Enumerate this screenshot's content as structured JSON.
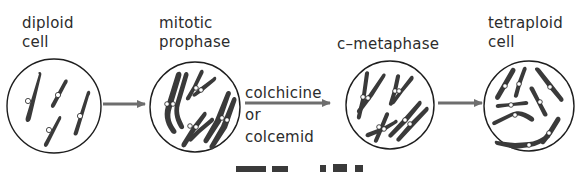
{
  "diagram": {
    "stages": [
      {
        "id": "diploid",
        "label_line1": "diploid",
        "label_line2": "cell"
      },
      {
        "id": "prophase",
        "label_line1": "mitotic",
        "label_line2": "prophase"
      },
      {
        "id": "c-metaphase",
        "label_line1": "c–metaphase",
        "label_line2": ""
      },
      {
        "id": "tetraploid",
        "label_line1": "tetraploid",
        "label_line2": "cell"
      }
    ],
    "treatment": {
      "line1": "colchicine",
      "line2": "or",
      "line3": "colcemid"
    },
    "colors": {
      "chromosome": "#3a3a3a",
      "outline": "#1e1e1e",
      "arrow": "#6e6e6e",
      "centromere": "#ffffff"
    }
  }
}
